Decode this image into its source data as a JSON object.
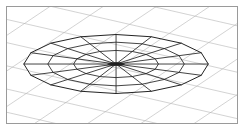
{
  "figure": {
    "caption": "",
    "width_px": 245,
    "height_px": 131
  },
  "frame": {
    "border_color": "#9a9a9a",
    "background_color": "#ffffff",
    "margin_px": 6,
    "border_width_px": 1
  },
  "ground_grid": {
    "label": "perspective ground plane grid",
    "line_color": "#b4b4b4",
    "line_width": 0.6,
    "pattern": "rhombic",
    "family_a_label": "down-right shallow lines",
    "family_a_count": 9,
    "family_a_slope_deg": 13,
    "family_b_label": "up-right steep lines",
    "family_b_count": 9,
    "family_b_slope_deg": -34
  },
  "disc": {
    "label": "faceted ellipse disc wireframe",
    "line_color": "#1f1f1f",
    "line_width": 0.85,
    "center_x": 110,
    "center_y": 58,
    "radius_x": 93,
    "radius_y": 30,
    "rim_segments": 16,
    "spoke_count": 16,
    "rings": [
      1.0,
      0.74,
      0.46
    ],
    "ring_count": 3,
    "hub_label": "center convergence hub",
    "hub_radius_x": 9,
    "hub_radius_y": 2
  },
  "chart_data": {
    "type": "scatter",
    "xlabel": "",
    "ylabel": "",
    "xlim": [
      0,
      232
    ],
    "ylim": [
      0,
      118
    ],
    "grid": true,
    "legend": "none",
    "series": [
      {
        "name": "disc rim polygon (16 vertices)",
        "values": [
          93,
          30
        ]
      },
      {
        "name": "radial spokes to center",
        "values": [
          16
        ]
      },
      {
        "name": "concentric rings (relative radii)",
        "values": [
          1.0,
          0.74,
          0.46
        ]
      }
    ]
  }
}
